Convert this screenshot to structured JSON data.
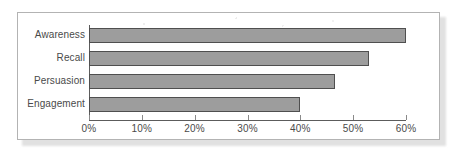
{
  "chart_data": {
    "type": "bar",
    "orientation": "horizontal",
    "title": "",
    "subtitle": "",
    "xlabel": "",
    "ylabel": "",
    "categories": [
      "Awareness",
      "Recall",
      "Persuasion",
      "Engagement"
    ],
    "values": [
      60,
      53,
      46.5,
      40
    ],
    "value_unit": "%",
    "xlim": [
      0,
      60
    ],
    "xticks": [
      0,
      10,
      20,
      30,
      40,
      50,
      60
    ],
    "xtick_labels": [
      "0%",
      "10%",
      "20%",
      "30%",
      "40%",
      "50%",
      "60%"
    ],
    "grid": false,
    "legend": false,
    "legend_position": "none",
    "series": [
      {
        "name": "",
        "values": [
          60,
          53,
          46.5,
          40
        ]
      }
    ],
    "colors": {
      "bar_fill": "#9d9d9d",
      "bar_border": "#4f4f4f",
      "axis": "#5c5c5c",
      "tick": "#8a8a8a",
      "text": "#4a4a4a",
      "frame": "#b3b3b3",
      "background": "#ffffff"
    }
  }
}
